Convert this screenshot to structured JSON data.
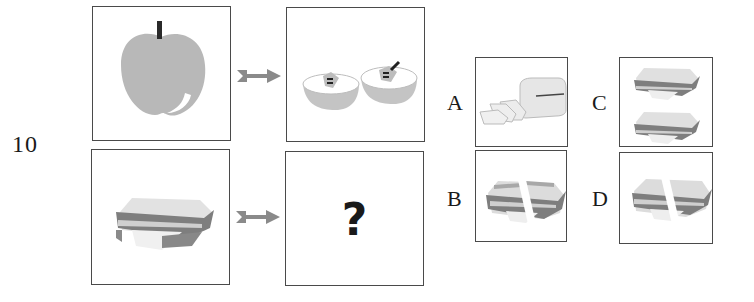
{
  "question": {
    "number": "10",
    "unknown_mark": "?"
  },
  "puzzle": {
    "row1": {
      "left_item": "whole apple",
      "right_item": "apple cut in two halves"
    },
    "row2": {
      "left_item": "sandwich",
      "right_item": "unknown"
    },
    "arrow_icon": "right-arrow-icon"
  },
  "options": [
    {
      "label": "A",
      "content": "loaf of bread with slices"
    },
    {
      "label": "B",
      "content": "sandwich cut in two (diagonal cut)"
    },
    {
      "label": "C",
      "content": "two sandwiches"
    },
    {
      "label": "D",
      "content": "sandwich cut in two"
    }
  ],
  "colors": {
    "frame": "#4a4a4a",
    "apple": "#b8b8b8",
    "stem": "#2a2a2a",
    "arrow": "#8a8a8a",
    "bread_top": "#dcdcdc",
    "crust": "#7a7a7a",
    "filling": "#ececec"
  }
}
